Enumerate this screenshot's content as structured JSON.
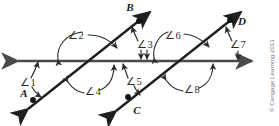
{
  "figure": {
    "name": "parallel-lines-transversal-diagram",
    "credit": "© Cengage Learning 2013",
    "colors": {
      "horizontal_line": "#4a4a4a",
      "transversal_line": "#1f1f1f",
      "arc": "#2b2b2b",
      "label": "#1a1a1a",
      "credit": "#7a7a7a",
      "background": "#ffffff"
    },
    "points": [
      {
        "id": "point-a",
        "label": "A",
        "x": 33,
        "y": 100,
        "label_x": 24,
        "label_y": 97
      },
      {
        "id": "point-b",
        "label": "B",
        "x": 139,
        "y": 21,
        "label_x": 130,
        "label_y": 11
      },
      {
        "id": "point-c",
        "label": "C",
        "x": 128,
        "y": 97,
        "label_x": 137,
        "label_y": 112
      },
      {
        "id": "point-d",
        "label": "D",
        "x": 230,
        "y": 20,
        "label_x": 241,
        "label_y": 24
      }
    ],
    "angles": [
      {
        "id": "angle-1",
        "label": "∠1",
        "label_x": 27,
        "label_y": 83
      },
      {
        "id": "angle-2",
        "label": "∠2",
        "label_x": 74,
        "label_y": 39
      },
      {
        "id": "angle-3",
        "label": "∠3",
        "label_x": 141,
        "label_y": 45
      },
      {
        "id": "angle-4",
        "label": "∠4",
        "label_x": 91,
        "label_y": 91
      },
      {
        "id": "angle-5",
        "label": "∠5",
        "label_x": 132,
        "label_y": 82
      },
      {
        "id": "angle-6",
        "label": "∠6",
        "label_x": 172,
        "label_y": 39
      },
      {
        "id": "angle-7",
        "label": "∠7",
        "label_x": 236,
        "label_y": 45
      },
      {
        "id": "angle-8",
        "label": "∠8",
        "label_x": 190,
        "label_y": 89
      }
    ],
    "lines": [
      {
        "id": "horizontal-line",
        "kind": "double-arrow",
        "from": [
          8,
          61
        ],
        "to": [
          262,
          61
        ]
      },
      {
        "id": "transversal-line-ab",
        "kind": "double-arrow",
        "from": [
          20,
          115
        ],
        "to": [
          158,
          6
        ]
      },
      {
        "id": "transversal-line-cd",
        "kind": "double-arrow",
        "from": [
          108,
          117
        ],
        "to": [
          249,
          6
        ]
      }
    ],
    "intersections": [
      {
        "id": "intersection-left",
        "x": 88,
        "y": 61
      },
      {
        "id": "intersection-right",
        "x": 180,
        "y": 61
      }
    ]
  }
}
